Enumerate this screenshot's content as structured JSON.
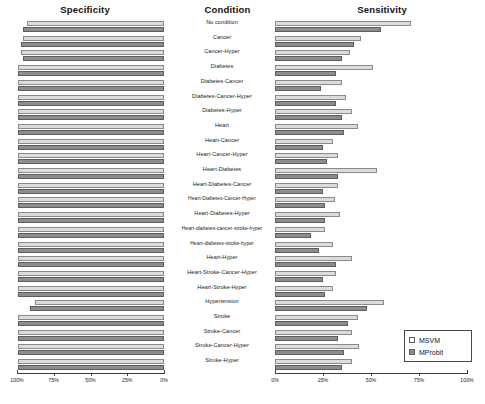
{
  "titles": {
    "specificity": "Specificity",
    "condition": "Condition",
    "sensitivity": "Sensitivity"
  },
  "legend": {
    "items": [
      {
        "label": "MSVM",
        "color": "#ffffff",
        "swatch": "msvm"
      },
      {
        "label": "MProbit",
        "color": "#8d8d8d",
        "swatch": "mprobit"
      }
    ]
  },
  "axes": {
    "left": {
      "label": "Specificity",
      "ticks": [
        "100%",
        "75%",
        "50%",
        "25%",
        "0%"
      ],
      "reversed": true,
      "range": [
        0,
        100
      ]
    },
    "right": {
      "label": "Sensitivity",
      "ticks": [
        "0%",
        "25%",
        "50%",
        "75%",
        "100%"
      ],
      "reversed": false,
      "range": [
        0,
        100
      ]
    }
  },
  "chart_data": {
    "type": "bar",
    "orientation": "horizontal",
    "layout": "paired-butterfly",
    "xlabel": "",
    "ylabel": "Condition",
    "grid": false,
    "legend_position": "bottom-right",
    "categories": [
      "No condition",
      "Cancer",
      "Cancer-Hyper",
      "Diabetes",
      "Diabetes-Cancer",
      "Diabetes-Cancer-Hyper",
      "Diabetes-Hyper",
      "Heart",
      "Heart-Cancer",
      "Heart-Cancer-Hyper",
      "Heart-Diabetes",
      "Heart-Diabetes-Cancer",
      "Heart-Diabetes-Cancer-Hyper",
      "Heart-Diabetes-Hyper",
      "Heart-diabetes-cancer-stroke-hyper",
      "Heart-diabetes-stroke-hyper",
      "Heart-Hyper",
      "Heart-Stroke-Cancer-Hyper",
      "Heart-Stroke-Hyper",
      "Hypertension",
      "Stroke",
      "Stroke-Cancer",
      "Stroke-Cancer-Hyper",
      "Stroke-Hyper"
    ],
    "panels": [
      {
        "name": "Specificity",
        "axis": "left",
        "series": [
          {
            "name": "MSVM",
            "values": [
              93,
              96,
              97,
              99,
              99,
              99,
              99,
              99,
              99,
              99,
              99,
              99,
              99,
              99,
              99,
              99,
              99,
              99,
              99,
              88,
              99,
              99,
              99,
              99
            ]
          },
          {
            "name": "MProbit",
            "values": [
              96,
              97,
              96,
              99,
              99,
              99,
              99,
              99,
              99,
              99,
              99,
              99,
              99,
              99,
              99,
              99,
              99,
              99,
              99,
              91,
              99,
              99,
              99,
              99
            ]
          }
        ]
      },
      {
        "name": "Sensitivity",
        "axis": "right",
        "series": [
          {
            "name": "MSVM",
            "values": [
              71,
              45,
              39,
              51,
              35,
              37,
              40,
              43,
              30,
              33,
              53,
              33,
              31,
              34,
              26,
              30,
              40,
              32,
              30,
              57,
              43,
              40,
              44,
              40
            ]
          },
          {
            "name": "MProbit",
            "values": [
              55,
              41,
              35,
              32,
              24,
              32,
              35,
              36,
              25,
              27,
              33,
              25,
              26,
              26,
              19,
              23,
              32,
              25,
              26,
              48,
              38,
              33,
              36,
              35
            ]
          }
        ]
      }
    ]
  }
}
